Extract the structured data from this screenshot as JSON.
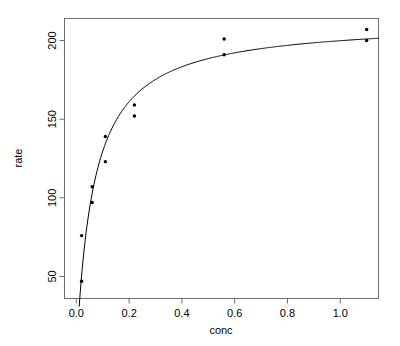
{
  "figure": {
    "background_color": "#ffffff",
    "foreground_color": "#000000",
    "box_color": "#6e6e6e",
    "width": 400,
    "height": 346
  },
  "chart_data": {
    "type": "scatter",
    "title": "",
    "subtitle": "",
    "xlabel": "conc",
    "ylabel": "rate",
    "grid": false,
    "legend": null,
    "xlim": [
      -0.0448,
      1.1448
    ],
    "ylim": [
      36.0,
      214.0
    ],
    "xticks": [
      0.0,
      0.2,
      0.4,
      0.6,
      0.8,
      1.0
    ],
    "xticklabels": [
      "0.0",
      "0.2",
      "0.4",
      "0.6",
      "0.8",
      "1.0"
    ],
    "yticks": [
      50,
      100,
      150,
      200
    ],
    "yticklabels": [
      "50",
      "100",
      "150",
      "200"
    ],
    "points_label": "observed",
    "points_marker": "filled-circle",
    "points_color": "#000000",
    "x": [
      0.02,
      0.02,
      0.06,
      0.06,
      0.11,
      0.11,
      0.22,
      0.22,
      0.56,
      0.56,
      1.1,
      1.1
    ],
    "y": [
      76,
      47,
      97,
      107,
      123,
      139,
      159,
      152,
      191,
      201,
      207,
      200
    ],
    "curve_label": "Michaelis-Menten fit",
    "curve_color": "#000000",
    "curve_formula": "rate = Vm * conc / (K + conc)",
    "curve_params": {
      "Vm": 212.7,
      "K": 0.0641
    }
  }
}
